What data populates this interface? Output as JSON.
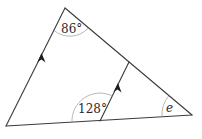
{
  "diagram": {
    "type": "geometry-triangle-with-parallel-line",
    "angles": {
      "top": {
        "label": "86°"
      },
      "interior": {
        "label": "128°"
      },
      "right": {
        "label": "e"
      }
    },
    "parallel_marks": {
      "left_edge": "arrow",
      "inner_line": "arrow"
    },
    "colors": {
      "line": "#3a3a3a",
      "arc": "#9a9a9a",
      "text": "#2a2a2a",
      "background": "#ffffff"
    }
  }
}
